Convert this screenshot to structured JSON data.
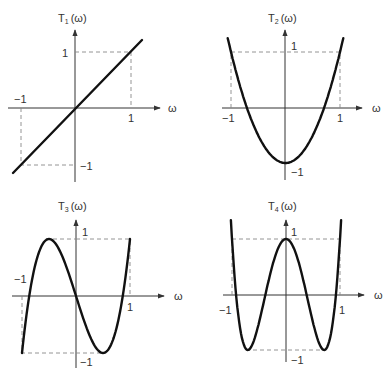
{
  "figure": {
    "axis_symbol": "ω",
    "tick_pos": "1",
    "tick_neg": "−1"
  },
  "chart_data": [
    {
      "type": "line",
      "title": "T1(ω)",
      "title_base": "T",
      "title_sub": "1",
      "title_arg": "(ω)",
      "xlabel": "ω",
      "ylabel": "T1(ω)",
      "xlim": [
        -1,
        1
      ],
      "ylim": [
        -1,
        1
      ],
      "xticks": [
        "−1",
        "1"
      ],
      "yticks": [
        "1",
        "−1"
      ],
      "formula": "T1(ω) = ω",
      "x": [
        -1.0,
        -0.5,
        0.0,
        0.5,
        1.0
      ],
      "values": [
        -1.0,
        -0.5,
        0.0,
        0.5,
        1.0
      ],
      "annotations": [
        "dashed guide lines at ω=±1 and T=±1"
      ]
    },
    {
      "type": "line",
      "title": "T2(ω)",
      "title_base": "T",
      "title_sub": "2",
      "title_arg": "(ω)",
      "xlabel": "ω",
      "ylabel": "T2(ω)",
      "xlim": [
        -1,
        1
      ],
      "ylim": [
        -1,
        1
      ],
      "xticks": [
        "−1",
        "1"
      ],
      "yticks": [
        "1",
        "−1"
      ],
      "formula": "T2(ω) = 2ω² − 1",
      "x": [
        -1.0,
        -0.707,
        -0.5,
        0.0,
        0.5,
        0.707,
        1.0
      ],
      "values": [
        1.0,
        0.0,
        -0.5,
        -1.0,
        -0.5,
        0.0,
        1.0
      ],
      "annotations": [
        "dashed guide lines at ω=±1 and T=1"
      ]
    },
    {
      "type": "line",
      "title": "T3(ω)",
      "title_base": "T",
      "title_sub": "3",
      "title_arg": "(ω)",
      "xlabel": "ω",
      "ylabel": "T3(ω)",
      "xlim": [
        -1,
        1
      ],
      "ylim": [
        -1,
        1
      ],
      "xticks": [
        "−1",
        "1"
      ],
      "yticks": [
        "1",
        "−1"
      ],
      "formula": "T3(ω) = 4ω³ − 3ω",
      "x": [
        -1.0,
        -0.866,
        -0.5,
        0.0,
        0.5,
        0.866,
        1.0
      ],
      "values": [
        -1.0,
        0.0,
        1.0,
        0.0,
        -1.0,
        0.0,
        1.0
      ],
      "annotations": [
        "dashed guide lines at ω=±1 and T=±1"
      ]
    },
    {
      "type": "line",
      "title": "T4(ω)",
      "title_base": "T",
      "title_sub": "4",
      "title_arg": "(ω)",
      "xlabel": "ω",
      "ylabel": "T4(ω)",
      "xlim": [
        -1,
        1
      ],
      "ylim": [
        -1,
        1
      ],
      "xticks": [
        "−1",
        "1"
      ],
      "yticks": [
        "1",
        "−1"
      ],
      "formula": "T4(ω) = 8ω⁴ − 8ω² + 1",
      "x": [
        -1.0,
        -0.924,
        -0.707,
        -0.383,
        0.0,
        0.383,
        0.707,
        0.924,
        1.0
      ],
      "values": [
        1.0,
        0.0,
        -1.0,
        0.0,
        1.0,
        0.0,
        -1.0,
        0.0,
        1.0
      ],
      "annotations": [
        "dashed guide lines at ω=±1 and T=±1"
      ]
    }
  ]
}
